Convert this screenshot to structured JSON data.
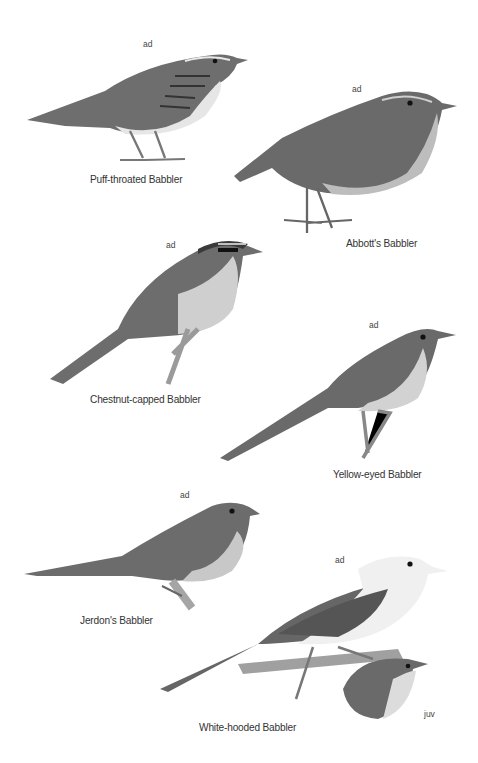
{
  "plate": {
    "birds": [
      {
        "name": "Puff-throated Babbler",
        "age": "ad"
      },
      {
        "name": "Abbott's Babbler",
        "age": "ad"
      },
      {
        "name": "Chestnut-capped Babbler",
        "age": "ad"
      },
      {
        "name": "Yellow-eyed Babbler",
        "age": "ad"
      },
      {
        "name": "Jerdon's Babbler",
        "age": "ad"
      },
      {
        "name": "White-hooded Babbler",
        "age": "ad",
        "inset_age": "juv"
      }
    ]
  },
  "colors": {
    "background": "#ffffff",
    "label_text": "#333333",
    "plumage_dark": "#5a5a5a",
    "plumage_mid": "#7a7a7a",
    "plumage_light": "#d8d8d8"
  }
}
